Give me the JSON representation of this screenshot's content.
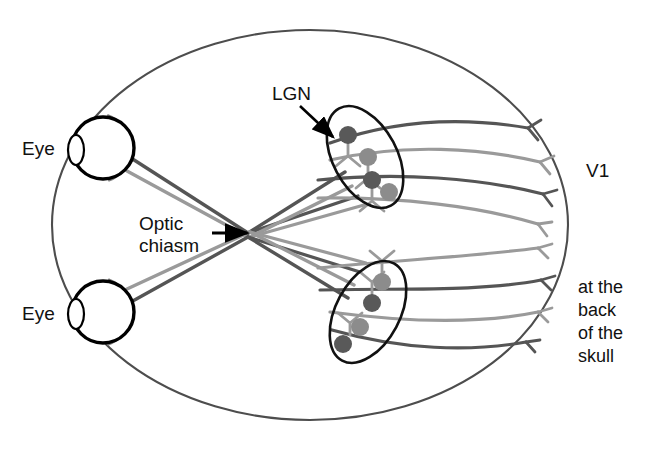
{
  "figure": {
    "title": "Visual pathway from the eyes through the optic chiasm and LGN to V1",
    "background_color": "#ffffff"
  },
  "labels": {
    "eye_top": "Eye",
    "eye_bottom": "Eye",
    "lgn": "LGN",
    "optic_chiasm_line1": "Optic",
    "optic_chiasm_line2": "chiasm",
    "v1": "V1",
    "back_of_skull_line1": "at the",
    "back_of_skull_line2": "back",
    "back_of_skull_line3": "of the",
    "back_of_skull_line4": "skull"
  },
  "colors": {
    "head_outline": "#4d4d4d",
    "eye_outline": "#000000",
    "retina_arc": "#808080",
    "lgn_outline": "#111111",
    "fiber_dark": "#555555",
    "fiber_light": "#9a9a9a",
    "cell_dark": "#595959",
    "cell_light": "#8c8c8c",
    "arrow": "#000000",
    "text": "#111111"
  },
  "structures": {
    "head": {
      "name": "head-outline",
      "shape": "ellipse",
      "cx": 310,
      "cy": 225,
      "rx": 258,
      "ry": 195
    },
    "eyes": [
      {
        "name": "eye-top",
        "cx": 103,
        "cy": 148,
        "r": 31
      },
      {
        "name": "eye-bottom",
        "cx": 103,
        "cy": 312,
        "r": 31
      }
    ],
    "lgn_bodies": [
      {
        "name": "lgn-top",
        "cx": 365,
        "cy": 157,
        "rx": 32,
        "ry": 55,
        "rotation": -28
      },
      {
        "name": "lgn-bottom",
        "cx": 368,
        "cy": 312,
        "rx": 32,
        "ry": 55,
        "rotation": 28
      }
    ],
    "lgn_cells": {
      "top": [
        {
          "cx": 348,
          "cy": 135,
          "r": 9,
          "tone": "dark"
        },
        {
          "cx": 368,
          "cy": 157,
          "r": 9,
          "tone": "light"
        },
        {
          "cx": 372,
          "cy": 180,
          "r": 9,
          "tone": "dark"
        },
        {
          "cx": 389,
          "cy": 192,
          "r": 9,
          "tone": "light"
        }
      ],
      "bottom": [
        {
          "cx": 382,
          "cy": 282,
          "r": 9,
          "tone": "light"
        },
        {
          "cx": 372,
          "cy": 303,
          "r": 9,
          "tone": "dark"
        },
        {
          "cx": 360,
          "cy": 327,
          "r": 9,
          "tone": "light"
        },
        {
          "cx": 343,
          "cy": 344,
          "r": 9,
          "tone": "dark"
        }
      ]
    },
    "optic_chiasm": {
      "name": "optic-chiasm",
      "x": 248,
      "y": 233
    },
    "v1_terminal_count": 8
  },
  "label_positions": {
    "eye_top": {
      "x": 22,
      "y": 150
    },
    "eye_bottom": {
      "x": 22,
      "y": 315
    },
    "lgn": {
      "x": 272,
      "y": 95
    },
    "optic_chiasm": {
      "x": 139,
      "y": 225
    },
    "v1": {
      "x": 586,
      "y": 172
    },
    "back_of_skull": {
      "x": 578,
      "y": 288
    }
  },
  "arrows": {
    "lgn_arrow": {
      "x1": 300,
      "y1": 106,
      "x2": 333,
      "y2": 137
    },
    "chiasm_arrow": {
      "x1": 212,
      "y1": 233,
      "x2": 247,
      "y2": 233
    }
  }
}
